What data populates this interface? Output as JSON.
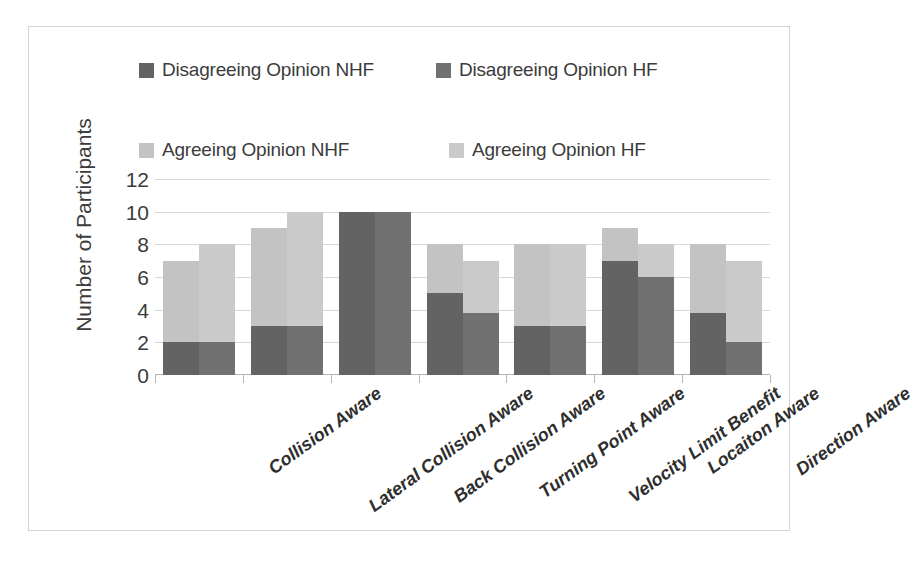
{
  "chart_data": {
    "type": "bar",
    "subtype": "stacked-grouped",
    "title": "",
    "xlabel": "",
    "ylabel": "Number of Participants",
    "ylim": [
      0,
      12
    ],
    "yticks": [
      0,
      2,
      4,
      6,
      8,
      10,
      12
    ],
    "grid": true,
    "legend_position": "top",
    "categories": [
      "Collision Aware",
      "Lateral Collision Aware",
      "Back Collision Aware",
      "Turning Point Aware",
      "Velocity Limit Benefit",
      "Locaiton Aware",
      "Direction Aware"
    ],
    "series": [
      {
        "name": "Disagreeing Opinion NHF",
        "color": "#636363",
        "group": "NHF",
        "stack_part": "bottom",
        "values": [
          2,
          3,
          10,
          5,
          3,
          7,
          3.8
        ]
      },
      {
        "name": "Agreeing Opinion NHF",
        "color": "#c3c3c3",
        "group": "NHF",
        "stack_part": "top",
        "values": [
          5,
          6,
          0,
          3,
          5,
          2,
          4.2
        ]
      },
      {
        "name": "Disagreeing Opinion HF",
        "color": "#717171",
        "group": "HF",
        "stack_part": "bottom",
        "values": [
          2,
          3,
          10,
          3.8,
          3,
          6,
          2
        ]
      },
      {
        "name": "Agreeing Opinion HF",
        "color": "#cacaca",
        "group": "HF",
        "stack_part": "top",
        "values": [
          6,
          7,
          0,
          3.2,
          5,
          2,
          5
        ]
      }
    ],
    "totals": {
      "NHF": [
        7,
        9,
        10,
        8,
        8,
        9,
        8
      ],
      "HF": [
        8,
        10,
        10,
        7,
        8,
        8,
        7
      ]
    }
  },
  "legend": {
    "rows": [
      [
        {
          "label": "Disagreeing Opinion NHF",
          "color": "#636363",
          "icon": "legend-swatch-icon"
        },
        {
          "label": "Disagreeing Opinion HF",
          "color": "#717171",
          "icon": "legend-swatch-icon"
        }
      ],
      [
        {
          "label": "Agreeing Opinion NHF",
          "color": "#c3c3c3",
          "icon": "legend-swatch-icon"
        },
        {
          "label": "Agreeing Opinion HF",
          "color": "#cacaca",
          "icon": "legend-swatch-icon"
        }
      ]
    ]
  },
  "colors": {
    "disagree_nhf": "#636363",
    "disagree_hf": "#717171",
    "agree_nhf": "#c3c3c3",
    "agree_hf": "#cacaca",
    "gridline": "#d8d8d8",
    "axis": "#b5b5b5",
    "frame": "#d3d3d3",
    "text": "#3c3c3c"
  }
}
